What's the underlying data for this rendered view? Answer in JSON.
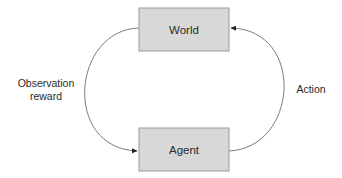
{
  "diagram": {
    "type": "cycle",
    "nodes": [
      {
        "id": "world",
        "label": "World"
      },
      {
        "id": "agent",
        "label": "Agent"
      }
    ],
    "edges": [
      {
        "from": "world",
        "to": "agent",
        "label_line1": "Observation",
        "label_line2": "reward",
        "side": "left"
      },
      {
        "from": "agent",
        "to": "world",
        "label": "Action",
        "side": "right"
      }
    ],
    "colors": {
      "box_fill": "#d8d8d8",
      "box_stroke": "#9a9a9a",
      "line": "#5a5a5a",
      "text": "#2a2a2a"
    }
  }
}
